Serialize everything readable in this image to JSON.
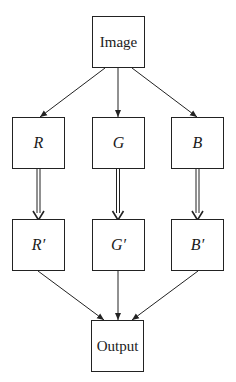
{
  "diagram": {
    "nodes": [
      {
        "id": "image",
        "label": "Image",
        "math": false,
        "x": 92,
        "y": 16,
        "w": 53,
        "h": 52
      },
      {
        "id": "r",
        "label": "R",
        "math": true,
        "x": 12,
        "y": 117,
        "w": 53,
        "h": 52
      },
      {
        "id": "g",
        "label": "G",
        "math": true,
        "x": 92,
        "y": 117,
        "w": 53,
        "h": 52
      },
      {
        "id": "b",
        "label": "B",
        "math": true,
        "x": 171,
        "y": 117,
        "w": 53,
        "h": 52
      },
      {
        "id": "r_prime",
        "label": "R′",
        "math": true,
        "x": 12,
        "y": 219,
        "w": 53,
        "h": 52
      },
      {
        "id": "g_prime",
        "label": "G′",
        "math": true,
        "x": 92,
        "y": 219,
        "w": 53,
        "h": 52
      },
      {
        "id": "b_prime",
        "label": "B′",
        "math": true,
        "x": 171,
        "y": 219,
        "w": 53,
        "h": 52
      },
      {
        "id": "output",
        "label": "Output",
        "math": false,
        "x": 91,
        "y": 320,
        "w": 53,
        "h": 52
      }
    ],
    "edges": [
      {
        "from": "image",
        "to": "r",
        "style": "single"
      },
      {
        "from": "image",
        "to": "g",
        "style": "single"
      },
      {
        "from": "image",
        "to": "b",
        "style": "single"
      },
      {
        "from": "r",
        "to": "r_prime",
        "style": "double"
      },
      {
        "from": "g",
        "to": "g_prime",
        "style": "double"
      },
      {
        "from": "b",
        "to": "b_prime",
        "style": "double"
      },
      {
        "from": "r_prime",
        "to": "output",
        "style": "single"
      },
      {
        "from": "g_prime",
        "to": "output",
        "style": "single"
      },
      {
        "from": "b_prime",
        "to": "output",
        "style": "single"
      }
    ]
  }
}
